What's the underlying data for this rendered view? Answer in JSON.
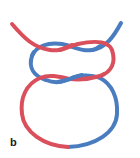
{
  "figure": {
    "panel_label": "b",
    "colors": {
      "strand_a": "#d9505c",
      "strand_b": "#4a7cc0",
      "background": "#ffffff"
    },
    "strand_width": 4
  }
}
